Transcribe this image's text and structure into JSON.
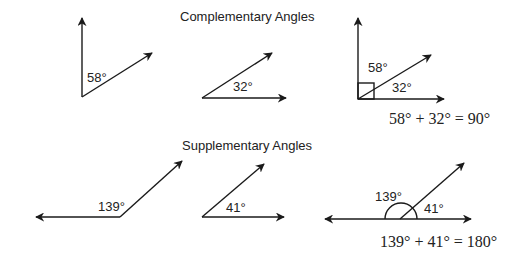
{
  "sections": {
    "complementary": {
      "title": "Complementary Angles",
      "angle_a": "58°",
      "angle_b": "32°",
      "combined_a": "58°",
      "combined_b": "32°",
      "equation": "58° + 32° = 90°"
    },
    "supplementary": {
      "title": "Supplementary Angles",
      "angle_a": "139°",
      "angle_b": "41°",
      "combined_a": "139°",
      "combined_b": "41°",
      "equation": "139° + 41° = 180°"
    }
  },
  "colors": {
    "stroke": "#1a1a1a",
    "text": "#222222"
  }
}
